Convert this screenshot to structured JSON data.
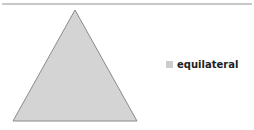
{
  "diagram": {
    "shape": "triangle",
    "fill": "#d4d4d4",
    "stroke": "#8a8a8a",
    "points": [
      [
        75,
        10
      ],
      [
        13,
        121
      ],
      [
        137,
        121
      ]
    ]
  },
  "legend": {
    "items": [
      {
        "label": "equilateral",
        "color": "#cccccc"
      }
    ]
  },
  "divider": {
    "color": "#c8c8c8"
  }
}
